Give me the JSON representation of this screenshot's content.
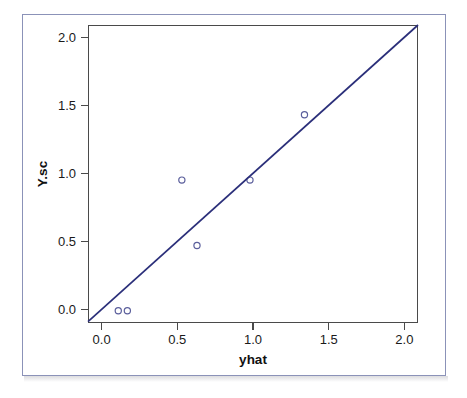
{
  "chart_data": {
    "type": "scatter",
    "title": "",
    "xlabel": "yhat",
    "ylabel": "Y.sc",
    "xlim": [
      -0.09,
      2.09
    ],
    "ylim": [
      -0.1,
      2.09
    ],
    "xticks": [
      0.0,
      0.5,
      1.0,
      1.5,
      2.0
    ],
    "yticks": [
      0.0,
      0.5,
      1.0,
      1.5,
      2.0
    ],
    "xticklabels": [
      "0.0",
      "0.5",
      "1.0",
      "1.5",
      "2.0"
    ],
    "yticklabels": [
      "0.0",
      "0.5",
      "1.0",
      "1.5",
      "2.0"
    ],
    "grid": false,
    "legend": null,
    "series": [
      {
        "name": "observations",
        "type": "scatter",
        "marker": "open-circle",
        "color": "#5b5f9c",
        "points": [
          {
            "x": 0.11,
            "y": -0.01
          },
          {
            "x": 0.17,
            "y": -0.01
          },
          {
            "x": 0.53,
            "y": 0.95
          },
          {
            "x": 0.63,
            "y": 0.47
          },
          {
            "x": 0.98,
            "y": 0.95
          },
          {
            "x": 1.34,
            "y": 1.43
          }
        ]
      },
      {
        "name": "identity-line",
        "type": "line",
        "color": "#2b2f7a",
        "x": [
          -0.09,
          2.09
        ],
        "y": [
          -0.09,
          2.09
        ]
      }
    ]
  },
  "figure": {
    "frame_color": "#8b92b8",
    "axis_color": "#4a4a4a",
    "background": "#ffffff"
  }
}
